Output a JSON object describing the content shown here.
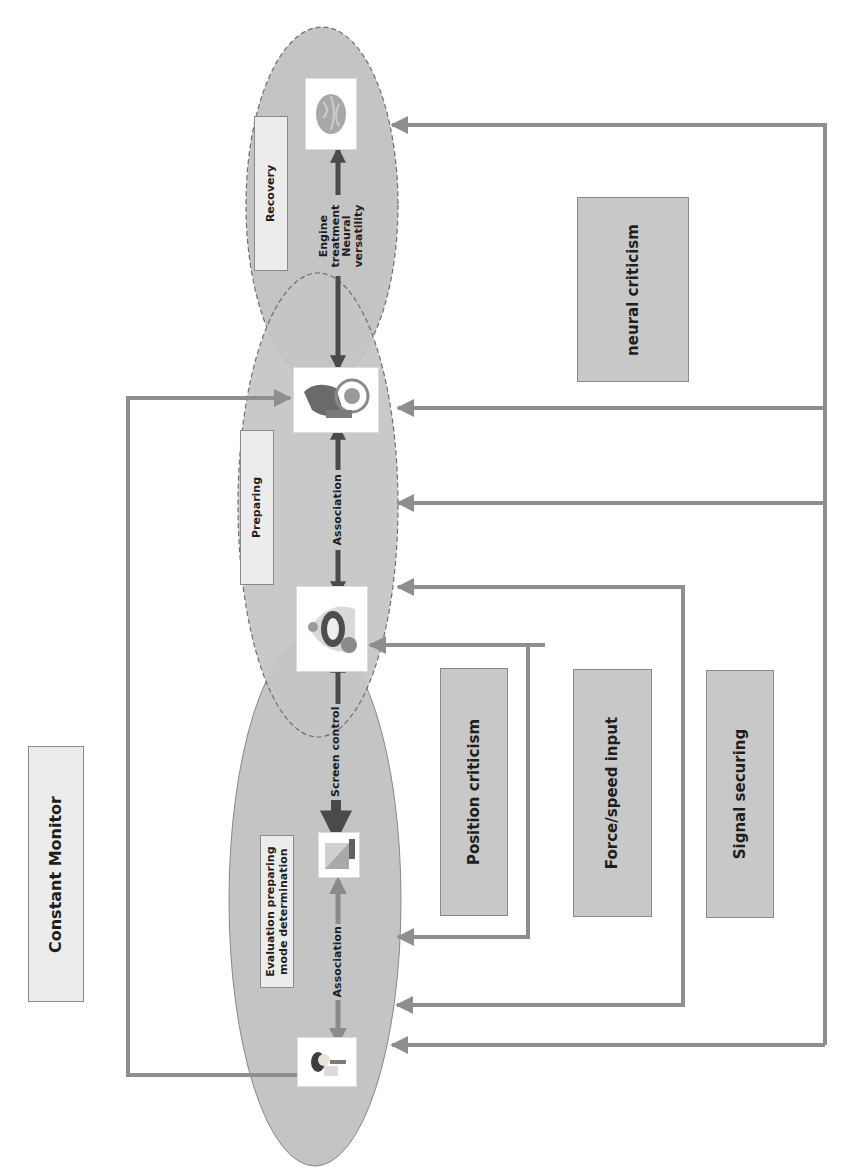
{
  "diagram": {
    "title_box": "Constant Monitor",
    "stages": [
      {
        "id": "evaluation",
        "label": "Evaluation preparing mode determination",
        "label_lines": [
          "Evaluation preparing",
          "mode determination"
        ]
      },
      {
        "id": "preparing",
        "label": "Preparing"
      },
      {
        "id": "recovery",
        "label": "Recovery"
      }
    ],
    "connectors": {
      "association_1": "Association",
      "screen_control": "Screen control",
      "association_2": "Association",
      "engine_treatment": [
        "Engine",
        "treatment",
        "Neural",
        "versatility"
      ]
    },
    "feedback_boxes": [
      {
        "id": "position",
        "label": "Position criticism"
      },
      {
        "id": "force",
        "label": "Force/speed input"
      },
      {
        "id": "signal",
        "label": "Signal securing"
      },
      {
        "id": "neural",
        "label": "neural criticism"
      }
    ],
    "icons": [
      {
        "id": "patient-icon",
        "stage": "evaluation"
      },
      {
        "id": "screen-icon",
        "stage": "evaluation"
      },
      {
        "id": "exoskeleton-icon",
        "stage": "preparing"
      },
      {
        "id": "wheelchair-robot-icon",
        "stage": "preparing"
      },
      {
        "id": "brain-icon",
        "stage": "recovery"
      }
    ],
    "colors": {
      "ellipse_fill": "#c4c4c4",
      "ellipse_stroke": "#777777",
      "feedback_line": "#8e8e8e",
      "main_arrow": "#4a4a4a",
      "light_box": "#ececec",
      "dark_box": "#c8c8c8"
    }
  }
}
